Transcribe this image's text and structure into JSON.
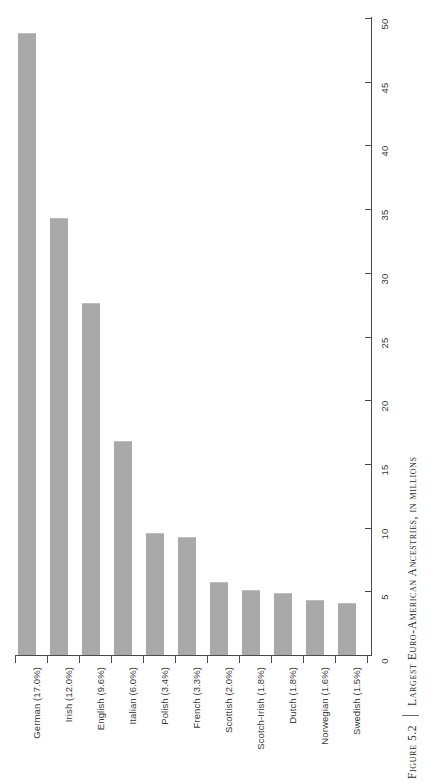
{
  "figure": {
    "number_label": "Figure 5.2",
    "caption_title": "Largest Euro-American Ancestries, in millions",
    "separator": "|"
  },
  "colors": {
    "bar_fill": "#a9a9a9",
    "axis": "#4a4a4a",
    "text": "#3a3a3a",
    "background": "#ffffff"
  },
  "chart_data": {
    "type": "bar",
    "title": "Largest Euro-American Ancestries, in millions",
    "xlabel": "",
    "ylabel": "",
    "ylim": [
      0,
      50
    ],
    "grid": false,
    "legend": null,
    "orientation": "vertical",
    "categories": [
      "German (17.0%)",
      "Irish (12.0%)",
      "English (9.6%)",
      "Italian (6.0%)",
      "Polish (3.4%)",
      "French (3.3%)",
      "Scottish (2.0%)",
      "Scotch-Irish (1.8%)",
      "Dutch (1.8%)",
      "Norwegian (1.6%)",
      "Swedish (1.5%)"
    ],
    "values": [
      48.8,
      34.3,
      27.6,
      16.8,
      9.6,
      9.3,
      5.7,
      5.1,
      4.9,
      4.3,
      4.1
    ],
    "percents": [
      "17.0%",
      "12.0%",
      "9.6%",
      "6.0%",
      "3.4%",
      "3.3%",
      "2.0%",
      "1.8%",
      "1.8%",
      "1.6%",
      "1.5%"
    ],
    "names": [
      "German",
      "Irish",
      "English",
      "Italian",
      "Polish",
      "French",
      "Scottish",
      "Scotch-Irish",
      "Dutch",
      "Norwegian",
      "Swedish"
    ],
    "yticks": [
      0,
      5,
      10,
      15,
      20,
      25,
      30,
      35,
      40,
      45,
      50
    ],
    "ytick_labels": [
      "0",
      "5",
      "10",
      "15",
      "20",
      "25",
      "30",
      "35",
      "40",
      "45",
      "50"
    ]
  }
}
